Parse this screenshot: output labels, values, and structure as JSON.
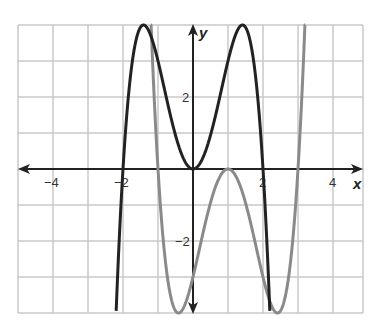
{
  "chart_data": {
    "type": "line",
    "title": "",
    "xlabel": "x",
    "ylabel": "y",
    "xlim": [
      -5,
      4.9
    ],
    "ylim": [
      -4,
      4
    ],
    "grid": true,
    "x_ticks": [
      {
        "value": -4,
        "label": "−4"
      },
      {
        "value": -2,
        "label": "−2"
      },
      {
        "value": 2,
        "label": "2"
      },
      {
        "value": 4,
        "label": "4"
      }
    ],
    "y_ticks": [
      {
        "value": 2,
        "label": "2"
      },
      {
        "value": -2,
        "label": "−2"
      }
    ],
    "series": [
      {
        "name": "black-curve",
        "color": "#222222",
        "expression": "-x^4 + 4x^2",
        "zeros": [
          -2,
          0,
          2
        ],
        "local_max": [
          [
            -1.41,
            4
          ],
          [
            1.41,
            4
          ]
        ],
        "local_min": [
          [
            0,
            0
          ]
        ]
      },
      {
        "name": "gray-curve",
        "color": "#8a8a8a",
        "expression": "(x-1)^4 - 4(x-1)^2",
        "zeros": [
          -1,
          1,
          3
        ],
        "local_min": [
          [
            -0.41,
            -4
          ],
          [
            2.41,
            -4
          ]
        ],
        "local_max": [
          [
            1,
            0
          ]
        ]
      }
    ]
  },
  "axes": {
    "x_label": "x",
    "y_label": "y"
  },
  "colors": {
    "grid": "#c8c8c8",
    "axis": "#222222",
    "black_curve": "#222222",
    "gray_curve": "#8a8a8a"
  }
}
